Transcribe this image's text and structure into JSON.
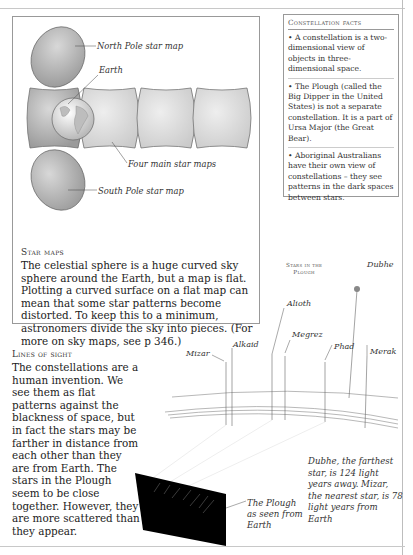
{
  "star_maps_panel": {
    "labels": {
      "north_pole": "North Pole star map",
      "earth": "Earth",
      "four_main": "Four main star maps",
      "south_pole": "South Pole star map"
    },
    "title": "Star maps",
    "body": "The celestial sphere is a huge curved sky sphere around the Earth, but a map is flat. Plotting a curved surface on a flat map can mean that some star patterns become distorted. To keep this to a minimum, astronomers divide the sky into pieces. (For more on sky maps, see p 346.)"
  },
  "constellation_facts": {
    "title": "Constellation facts",
    "items": [
      "• A constellation is a two-dimensional view of objects in three-dimensional space.",
      "• The Plough (called the Big Dipper in the United States) is not a separate constellation. It is a part of Ursa Major (the Great Bear).",
      "• Aboriginal Australians have their own view of constellations – they see patterns in the dark spaces between stars."
    ]
  },
  "lines_of_sight": {
    "title": "Lines of sight",
    "body": "The constellations are a human invention. We see them as flat patterns against the blackness of space, but in fact the stars may be farther in distance from each other than they are from Earth. The stars in the Plough seem to be close together. However, they are more scattered than they appear."
  },
  "plough_diagram": {
    "title_line1": "Stars in the",
    "title_line2": "Plough",
    "stars": [
      "Mizar",
      "Alkaid",
      "Alioth",
      "Megrez",
      "Phad",
      "Merak",
      "Dubhe"
    ],
    "plough_caption": "The Plough as seen from Earth",
    "distance_caption": "Dubhe, the farthest star, is 124 light years away. Mizar, the nearest star, is 78 light years from Earth"
  }
}
